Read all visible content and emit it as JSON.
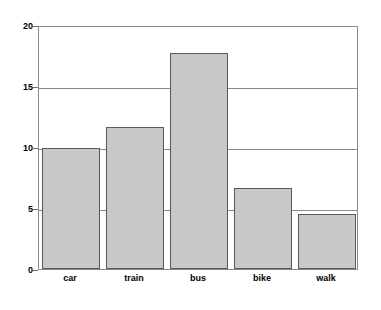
{
  "chart_data": {
    "type": "bar",
    "title": "",
    "subtitle": "",
    "xlabel": "",
    "ylabel": "",
    "categories": [
      "car",
      "train",
      "bus",
      "bike",
      "walk"
    ],
    "values": [
      9.9,
      11.6,
      17.7,
      6.6,
      4.5
    ],
    "series": [
      {
        "name": "",
        "values": [
          9.9,
          11.6,
          17.7,
          6.6,
          4.5
        ]
      }
    ],
    "ylim": [
      0,
      20
    ],
    "ytick_labels": [
      "0",
      "5",
      "10",
      "15",
      "20"
    ],
    "ytick_values": [
      0,
      5,
      10,
      15,
      20
    ],
    "gridlines": [
      5,
      10,
      15
    ],
    "grid": true,
    "legend": "none",
    "annotations": [],
    "colors": {
      "bar_fill": "#c8c8c8",
      "bar_border": "#595959",
      "axis": "#8a8a8a",
      "text": "#000000",
      "background": "#ffffff"
    }
  }
}
